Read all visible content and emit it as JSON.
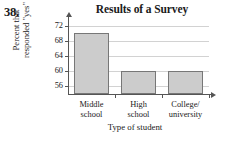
{
  "problem": {
    "number": "38."
  },
  "chart_data": {
    "type": "bar",
    "title": "Results of a Survey",
    "xlabel": "Type of student",
    "ylabel": "Percent that responded \"yes\"",
    "ylabel_lines": [
      "Percent that",
      "responded \"yes\""
    ],
    "categories": [
      "Middle school",
      "High school",
      "College/university"
    ],
    "category_label_lines": [
      [
        "Middle",
        "school"
      ],
      [
        "High",
        "school"
      ],
      [
        "College/",
        "university"
      ]
    ],
    "values": [
      70,
      60,
      60
    ],
    "ylim": [
      54,
      73
    ],
    "yticks": [
      56,
      60,
      64,
      68,
      72
    ],
    "ytick_labels": [
      "56",
      "60",
      "64",
      "68",
      "72"
    ],
    "grid": true,
    "legend": false,
    "bar_fill_color": "#cccccc",
    "bar_border_color": "#777777",
    "gridline_color": "#d2d2d2",
    "axis_color": "#555555"
  }
}
